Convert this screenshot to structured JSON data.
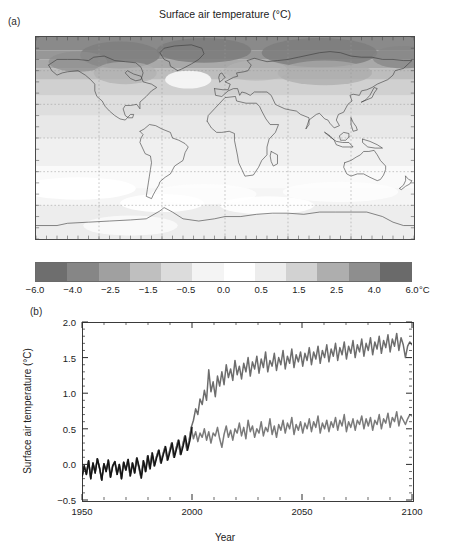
{
  "figure": {
    "title": "Surface air temperature (°C)",
    "panel_a_label": "(a)",
    "panel_b_label": "(b)"
  },
  "colorbar": {
    "unit": "°C",
    "tick_labels": [
      "−6.0",
      "−4.0",
      "−2.5",
      "−1.5",
      "−0.5",
      "0.0",
      "0.5",
      "1.5",
      "2.5",
      "4.0",
      "6.0"
    ],
    "band_colors": [
      "#6e6e6e",
      "#868686",
      "#a0a0a0",
      "#bfbfbf",
      "#dcdcdc",
      "#f4f4f4",
      "#ffffff",
      "#ededed",
      "#d2d2d2",
      "#aeaeae",
      "#8e8e8e",
      "#6a6a6a"
    ]
  },
  "map": {
    "projection": "equirectangular",
    "lon_range": [
      -180,
      180
    ],
    "lat_range": [
      -90,
      90
    ],
    "gridline_lon_step": 60,
    "gridline_lat_step": 30,
    "ocean_base_color": "#f0f0f0",
    "coastline_color": "#3a3a3a",
    "gridline_color": "#9a9a9a",
    "description": "Global map of projected surface air temperature change, grayscale shaded, strongest (darkest) warming over the Arctic and northern high latitudes, weak warming over the Southern Ocean and North Atlantic."
  },
  "chart_data": {
    "type": "line",
    "title": "",
    "xlabel": "Year",
    "ylabel": "Surface air temperature (°C)",
    "xlim": [
      1950,
      2100
    ],
    "ylim": [
      -0.5,
      2.0
    ],
    "xticks": [
      1950,
      2000,
      2050,
      2100
    ],
    "xtick_labels": [
      "1950",
      "2000",
      "2050",
      "2100"
    ],
    "yticks": [
      -0.5,
      0.0,
      0.5,
      1.0,
      1.5,
      2.0
    ],
    "ytick_labels": [
      "−0.5",
      "0.0",
      "0.5",
      "1.0",
      "1.5",
      "2.0"
    ],
    "x_minor_step": 10,
    "y_minor_step": 0.1,
    "grid": false,
    "legend": "none",
    "series": [
      {
        "name": "historical",
        "color": "#151515",
        "width": 1.5,
        "x_start": 1950,
        "x_end": 2000,
        "values": [
          -0.18,
          -0.02,
          -0.14,
          0.05,
          -0.2,
          0.02,
          -0.12,
          0.08,
          -0.05,
          -0.22,
          0.01,
          -0.1,
          0.06,
          -0.18,
          -0.02,
          0.04,
          -0.14,
          0.0,
          -0.2,
          0.03,
          -0.08,
          0.07,
          -0.16,
          0.02,
          -0.12,
          0.09,
          -0.04,
          -0.19,
          0.05,
          -0.1,
          0.12,
          -0.06,
          0.16,
          -0.02,
          0.1,
          0.2,
          0.02,
          0.14,
          0.25,
          0.06,
          0.18,
          0.3,
          0.1,
          0.22,
          0.34,
          0.14,
          0.26,
          0.4,
          0.2,
          0.33,
          0.52
        ]
      },
      {
        "name": "scenario-high",
        "color": "#6d6d6d",
        "width": 1.5,
        "x_start": 1950,
        "x_end": 2100,
        "values": [
          -0.18,
          -0.02,
          -0.14,
          0.05,
          -0.2,
          0.02,
          -0.12,
          0.08,
          -0.05,
          -0.22,
          0.01,
          -0.1,
          0.06,
          -0.18,
          -0.02,
          0.04,
          -0.14,
          0.0,
          -0.2,
          0.03,
          -0.08,
          0.07,
          -0.16,
          0.02,
          -0.12,
          0.09,
          -0.04,
          -0.19,
          0.05,
          -0.1,
          0.12,
          -0.06,
          0.16,
          -0.02,
          0.1,
          0.2,
          0.02,
          0.14,
          0.25,
          0.06,
          0.18,
          0.3,
          0.1,
          0.22,
          0.34,
          0.14,
          0.26,
          0.4,
          0.2,
          0.33,
          0.52,
          0.62,
          0.78,
          0.7,
          0.92,
          0.84,
          1.04,
          0.9,
          1.33,
          1.02,
          1.16,
          0.95,
          1.24,
          1.1,
          1.3,
          1.12,
          1.4,
          1.22,
          1.34,
          1.18,
          1.46,
          1.26,
          1.38,
          1.2,
          1.42,
          1.3,
          1.5,
          1.24,
          1.44,
          1.34,
          1.52,
          1.28,
          1.48,
          1.36,
          1.58,
          1.3,
          1.46,
          1.38,
          1.56,
          1.32,
          1.5,
          1.4,
          1.6,
          1.34,
          1.52,
          1.42,
          1.62,
          1.36,
          1.54,
          1.44,
          1.58,
          1.38,
          1.56,
          1.46,
          1.64,
          1.4,
          1.58,
          1.48,
          1.66,
          1.42,
          1.6,
          1.5,
          1.68,
          1.44,
          1.62,
          1.52,
          1.7,
          1.46,
          1.64,
          1.54,
          1.72,
          1.48,
          1.66,
          1.56,
          1.74,
          1.5,
          1.68,
          1.58,
          1.76,
          1.52,
          1.7,
          1.6,
          1.78,
          1.54,
          1.72,
          1.62,
          1.8,
          1.56,
          1.74,
          1.64,
          1.82,
          1.58,
          1.76,
          1.66,
          1.84,
          1.6,
          1.78,
          1.68,
          1.5,
          1.66,
          1.72,
          1.68
        ]
      },
      {
        "name": "scenario-low",
        "color": "#7a7a7a",
        "width": 1.5,
        "x_start": 1950,
        "x_end": 2100,
        "values": [
          -0.18,
          -0.02,
          -0.14,
          0.05,
          -0.2,
          0.02,
          -0.12,
          0.08,
          -0.05,
          -0.22,
          0.01,
          -0.1,
          0.06,
          -0.18,
          -0.02,
          0.04,
          -0.14,
          0.0,
          -0.2,
          0.03,
          -0.08,
          0.07,
          -0.16,
          0.02,
          -0.12,
          0.09,
          -0.04,
          -0.19,
          0.05,
          -0.1,
          0.12,
          -0.06,
          0.16,
          -0.02,
          0.1,
          0.2,
          0.02,
          0.14,
          0.25,
          0.06,
          0.18,
          0.3,
          0.1,
          0.22,
          0.34,
          0.14,
          0.26,
          0.4,
          0.2,
          0.33,
          0.52,
          0.36,
          0.46,
          0.32,
          0.44,
          0.38,
          0.5,
          0.34,
          0.46,
          0.3,
          0.44,
          0.4,
          0.52,
          0.36,
          0.24,
          0.42,
          0.54,
          0.38,
          0.48,
          0.34,
          0.5,
          0.44,
          0.58,
          0.4,
          0.52,
          0.36,
          0.62,
          0.46,
          0.54,
          0.38,
          0.5,
          0.44,
          0.6,
          0.4,
          0.52,
          0.46,
          0.64,
          0.42,
          0.54,
          0.38,
          0.56,
          0.48,
          0.62,
          0.44,
          0.58,
          0.5,
          0.66,
          0.42,
          0.56,
          0.48,
          0.6,
          0.44,
          0.58,
          0.5,
          0.64,
          0.46,
          0.6,
          0.52,
          0.68,
          0.44,
          0.58,
          0.5,
          0.62,
          0.46,
          0.6,
          0.52,
          0.66,
          0.48,
          0.62,
          0.54,
          0.7,
          0.46,
          0.6,
          0.52,
          0.64,
          0.48,
          0.62,
          0.56,
          0.68,
          0.5,
          0.64,
          0.54,
          0.66,
          0.48,
          0.62,
          0.56,
          0.7,
          0.5,
          0.64,
          0.58,
          0.72,
          0.52,
          0.66,
          0.6,
          0.74,
          0.54,
          0.68,
          0.62,
          0.56,
          0.64,
          0.7,
          0.68
        ]
      }
    ]
  }
}
